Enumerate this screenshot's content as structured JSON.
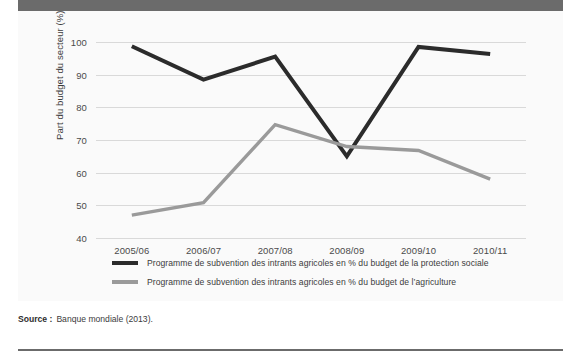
{
  "figure": {
    "background_color": "#fafafa",
    "banner_color": "#6b6b6b",
    "source_label": "Source :",
    "source_text": "Banque mondiale (2013)."
  },
  "chart_data": {
    "type": "line",
    "title": "",
    "xlabel": "",
    "ylabel": "Part du budget du secteur (%)",
    "categories": [
      "2005/06",
      "2006/07",
      "2007/08",
      "2008/09",
      "2009/10",
      "2010/11"
    ],
    "ylim": [
      40,
      100
    ],
    "yticks": [
      40,
      50,
      60,
      70,
      80,
      90,
      100
    ],
    "ytick_labels": [
      "40",
      "50",
      "60",
      "70",
      "80",
      "90",
      "100"
    ],
    "grid": true,
    "legend_position": "bottom",
    "series": [
      {
        "name": "Programme de subvention des intrants agricoles en % du budget de la protection sociale",
        "color": "#2b2b2b",
        "values": [
          98.7,
          88.5,
          95.5,
          65.0,
          98.5,
          96.3
        ]
      },
      {
        "name": "Programme de subvention des intrants agricoles en % du budget de l’agriculture",
        "color": "#9a9a9a",
        "values": [
          47.0,
          50.8,
          74.7,
          68.0,
          66.8,
          58.0
        ]
      }
    ]
  }
}
